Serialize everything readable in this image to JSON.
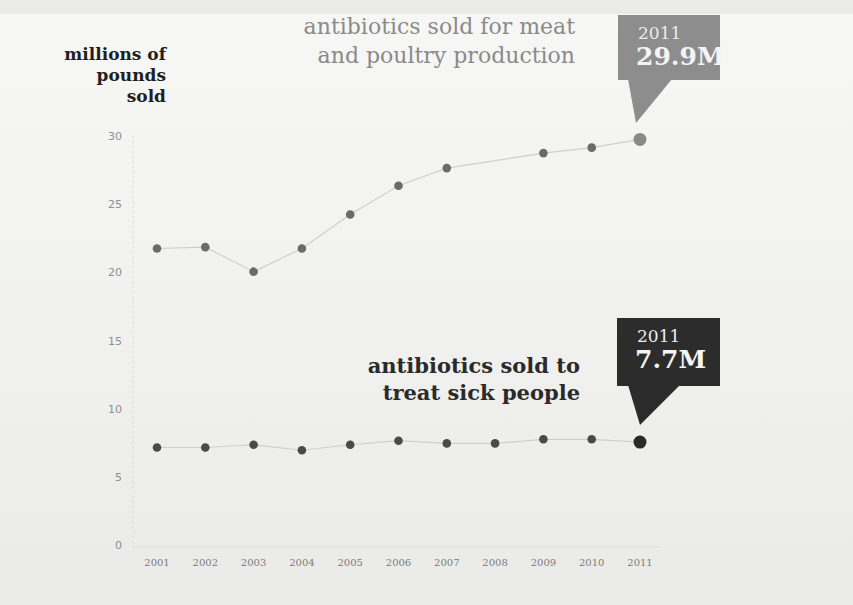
{
  "chart_data": {
    "type": "line",
    "title": "",
    "ylabel": "millions of pounds sold",
    "xlabel": "",
    "ylim": [
      0,
      30
    ],
    "yticks": [
      0,
      5,
      10,
      15,
      20,
      25,
      30
    ],
    "grid": false,
    "categories": [
      "2001",
      "2002",
      "2003",
      "2004",
      "2005",
      "2006",
      "2007",
      "2008",
      "2009",
      "2010",
      "2011"
    ],
    "series": [
      {
        "name": "antibiotics sold for meat and poultry production",
        "color": "#6e6e6e",
        "values": [
          21.9,
          22.0,
          20.2,
          21.9,
          24.4,
          26.5,
          27.8,
          null,
          28.9,
          29.3,
          29.9
        ]
      },
      {
        "name": "antibiotics sold to treat sick people",
        "color": "#4a4a4a",
        "values": [
          7.3,
          7.3,
          7.5,
          7.1,
          7.5,
          7.8,
          7.6,
          7.6,
          7.9,
          7.9,
          7.7
        ]
      }
    ],
    "annotations": [
      {
        "series": "meat",
        "year": "2011",
        "label": "29.9M"
      },
      {
        "series": "people",
        "year": "2011",
        "label": "7.7M"
      }
    ]
  },
  "labels": {
    "y_axis_lines": [
      "millions of",
      "pounds",
      "sold"
    ],
    "meat_title_lines": [
      "antibiotics sold for meat",
      "and poultry production"
    ],
    "people_title_lines": [
      "antibiotics sold to",
      "treat sick people"
    ],
    "meat_callout": {
      "year": "2011",
      "value": "29.9M",
      "color": "#8d8d8d"
    },
    "people_callout": {
      "year": "2011",
      "value": "7.7M",
      "color": "#2c2c2c"
    }
  }
}
